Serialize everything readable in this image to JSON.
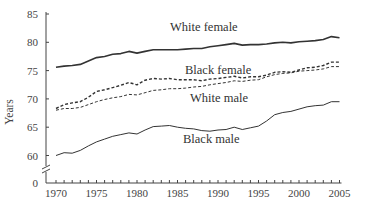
{
  "chart_data": {
    "type": "line",
    "title": "",
    "xlabel": "",
    "ylabel": "Years",
    "ylim": [
      60,
      85
    ],
    "y_axis_break": true,
    "y_axis_break_baseline": 0,
    "xlim": [
      1970,
      2005
    ],
    "grid": false,
    "legend": "inline labels",
    "y_ticks": [
      0,
      60,
      65,
      70,
      75,
      80,
      85
    ],
    "x_ticks": [
      1970,
      1975,
      1980,
      1985,
      1990,
      1995,
      2000,
      2005
    ],
    "x": [
      1970,
      1971,
      1972,
      1973,
      1974,
      1975,
      1976,
      1977,
      1978,
      1979,
      1980,
      1981,
      1982,
      1983,
      1984,
      1985,
      1986,
      1987,
      1988,
      1989,
      1990,
      1991,
      1992,
      1993,
      1994,
      1995,
      1996,
      1997,
      1998,
      1999,
      2000,
      2001,
      2002,
      2003,
      2004,
      2005
    ],
    "series": [
      {
        "name": "White female",
        "style": "solid",
        "color": "#333333",
        "width": 1.6,
        "label_pos": [
          170,
          31
        ],
        "values": [
          75.6,
          75.8,
          75.9,
          76.1,
          76.7,
          77.3,
          77.5,
          77.9,
          78.0,
          78.4,
          78.1,
          78.4,
          78.7,
          78.7,
          78.7,
          78.7,
          78.8,
          78.9,
          78.9,
          79.2,
          79.4,
          79.6,
          79.8,
          79.5,
          79.6,
          79.6,
          79.7,
          79.9,
          80.0,
          79.9,
          80.1,
          80.2,
          80.3,
          80.5,
          81.0,
          80.8
        ]
      },
      {
        "name": "Black female",
        "style": "dashed",
        "color": "#333333",
        "width": 1.4,
        "label_pos": [
          185,
          74
        ],
        "values": [
          68.3,
          69.0,
          69.3,
          69.5,
          70.3,
          71.3,
          71.6,
          72.0,
          72.4,
          72.9,
          72.5,
          73.3,
          73.6,
          73.5,
          73.6,
          73.4,
          73.4,
          73.4,
          73.2,
          73.5,
          73.6,
          73.8,
          74.0,
          73.7,
          73.9,
          73.9,
          74.2,
          74.7,
          74.8,
          74.7,
          75.1,
          75.5,
          75.6,
          75.9,
          76.5,
          76.5
        ]
      },
      {
        "name": "White male",
        "style": "dashed",
        "color": "#333333",
        "width": 1.0,
        "label_pos": [
          190,
          102
        ],
        "values": [
          68.0,
          68.3,
          68.3,
          68.5,
          69.0,
          69.5,
          69.9,
          70.2,
          70.4,
          70.8,
          70.7,
          71.1,
          71.5,
          71.6,
          71.8,
          71.8,
          71.9,
          72.1,
          72.2,
          72.5,
          72.7,
          72.9,
          73.2,
          73.1,
          73.3,
          73.4,
          73.9,
          74.3,
          74.5,
          74.6,
          74.9,
          75.0,
          75.1,
          75.3,
          75.7,
          75.7
        ]
      },
      {
        "name": "Black male",
        "style": "solid",
        "color": "#333333",
        "width": 1.0,
        "label_pos": [
          183,
          143
        ],
        "values": [
          60.0,
          60.5,
          60.4,
          60.9,
          61.7,
          62.4,
          62.9,
          63.4,
          63.7,
          64.0,
          63.8,
          64.5,
          65.1,
          65.2,
          65.3,
          65.0,
          64.8,
          64.7,
          64.4,
          64.3,
          64.5,
          64.6,
          65.0,
          64.6,
          64.9,
          65.2,
          66.1,
          67.2,
          67.6,
          67.8,
          68.2,
          68.6,
          68.8,
          68.9,
          69.5,
          69.5
        ]
      }
    ]
  }
}
